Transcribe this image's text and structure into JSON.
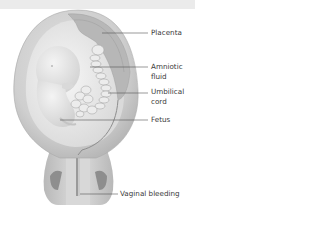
{
  "diagram": {
    "type": "anatomical-illustration",
    "labels": [
      {
        "id": "placenta",
        "text": "Placenta"
      },
      {
        "id": "amniotic-fluid",
        "line1": "Amniotic",
        "line2": "fluid"
      },
      {
        "id": "umbilical-cord",
        "line1": "Umbilical",
        "line2": "cord"
      },
      {
        "id": "fetus",
        "text": "Fetus"
      },
      {
        "id": "vaginal-bleeding",
        "text": "Vaginal bleeding"
      }
    ]
  },
  "colors": {
    "top_band": "#ebebeb",
    "uterus_outer": "#c8c8c8",
    "uterus_inner": "#dcdcdc",
    "amniotic": "#efefef",
    "placenta": "#b9b9b9",
    "fetus": "#e4e4e4",
    "leader_line": "#555555",
    "label_text": "#3a3a3a"
  }
}
